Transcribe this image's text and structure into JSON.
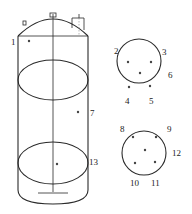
{
  "diagram": {
    "title": "",
    "tank": {
      "label_top_point": "1",
      "label_middle_point": "7",
      "label_bottom_point": "13"
    },
    "upper_cross_section": {
      "labels": [
        "2",
        "3",
        "4",
        "5",
        "6"
      ]
    },
    "lower_cross_section": {
      "labels": [
        "8",
        "9",
        "10",
        "11",
        "12"
      ]
    },
    "colors": {
      "line": "#2a2a2a",
      "point": "#444444",
      "background": "#ffffff"
    }
  }
}
